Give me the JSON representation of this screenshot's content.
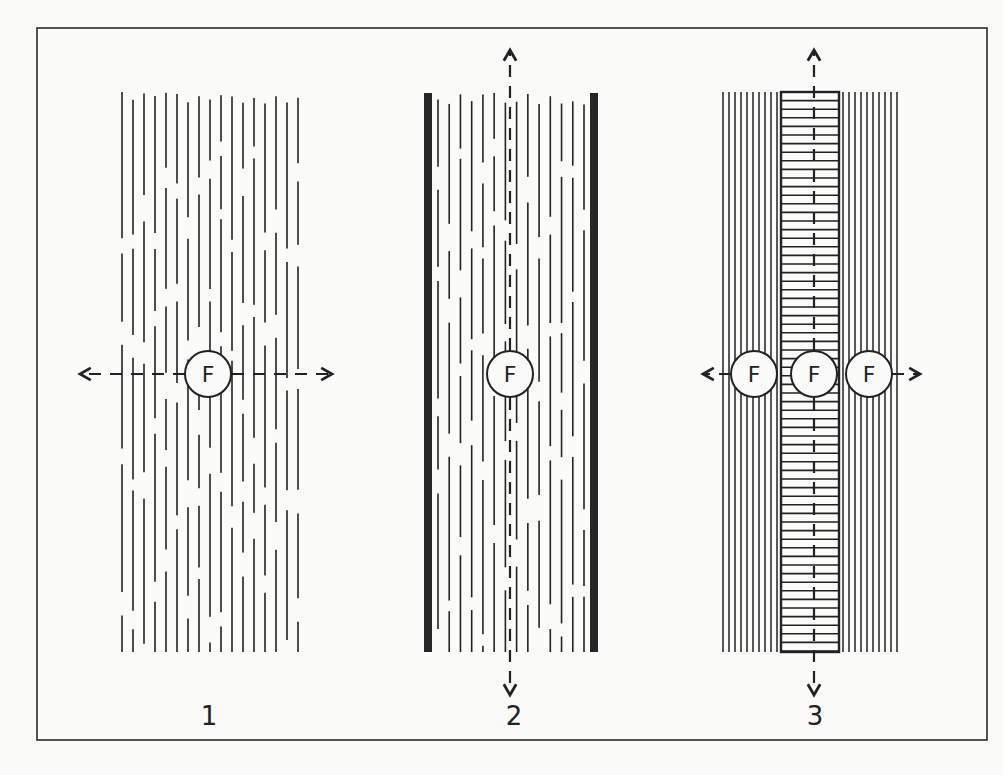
{
  "figure": {
    "frame": {
      "x": 37,
      "y": 28,
      "w": 950,
      "h": 712,
      "stroke": "#2a2a2a"
    },
    "ink_color": "#222222",
    "background": "#fbfbfa",
    "panels": [
      {
        "id": 1,
        "label": "1",
        "description": "Discontinuous (broken) parallel fibres, flow F outward in both horizontal directions",
        "x0": 122,
        "x1": 298,
        "y0": 92,
        "y1": 652,
        "line_count": 17,
        "pattern": "broken",
        "circles": [
          {
            "cx": 208,
            "cy": 374,
            "text": "F"
          }
        ],
        "arrows": [
          {
            "dir": "left",
            "x1": 185,
            "y1": 374,
            "x2": 80,
            "y2": 374
          },
          {
            "dir": "right",
            "x1": 232,
            "y1": 374,
            "x2": 332,
            "y2": 374
          }
        ],
        "label_pos": {
          "x": 209,
          "y": 725
        }
      },
      {
        "id": 2,
        "label": "2",
        "description": "Broken fibres bounded by two thick walls, flow F along vertical axis",
        "x0": 426,
        "x1": 596,
        "y0": 93,
        "y1": 652,
        "walls": [
          428,
          594
        ],
        "line_count": 14,
        "pattern": "broken",
        "circles": [
          {
            "cx": 510,
            "cy": 374,
            "text": "F"
          }
        ],
        "arrows": [
          {
            "dir": "up",
            "x1": 510,
            "y1": 350,
            "x2": 510,
            "y2": 50
          },
          {
            "dir": "down",
            "x1": 510,
            "y1": 398,
            "x2": 510,
            "y2": 695
          }
        ],
        "label_pos": {
          "x": 514,
          "y": 725
        }
      },
      {
        "id": 3,
        "label": "3",
        "description": "Continuous parallel fibres flanking a central ladder column (transverse plates); F at centre and both sides",
        "x0": 723,
        "x1": 897,
        "y0": 92,
        "y1": 652,
        "ladder": {
          "x0": 781,
          "x1": 839,
          "rung_spacing": 8.6
        },
        "line_count_side": 10,
        "pattern": "solid",
        "circles": [
          {
            "cx": 754,
            "cy": 374,
            "text": "F"
          },
          {
            "cx": 814,
            "cy": 374,
            "text": "F"
          },
          {
            "cx": 869,
            "cy": 374,
            "text": "F"
          }
        ],
        "arrows": [
          {
            "dir": "up",
            "x1": 814,
            "y1": 350,
            "x2": 814,
            "y2": 50
          },
          {
            "dir": "down",
            "x1": 814,
            "y1": 398,
            "x2": 814,
            "y2": 695
          },
          {
            "dir": "left",
            "x1": 731,
            "y1": 374,
            "x2": 703,
            "y2": 374
          },
          {
            "dir": "right",
            "x1": 892,
            "y1": 374,
            "x2": 920,
            "y2": 374
          }
        ],
        "label_pos": {
          "x": 815,
          "y": 725
        }
      }
    ]
  }
}
